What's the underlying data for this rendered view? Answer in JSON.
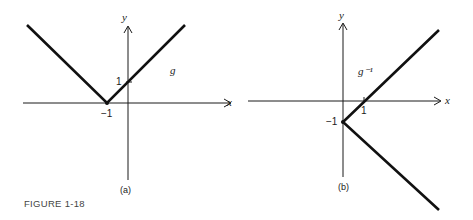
{
  "figure": {
    "caption": "FIGURE 1-18",
    "panels": [
      {
        "id": "a",
        "label": "(a)",
        "function_label": "g",
        "axis_x_label": "x",
        "axis_y_label": "y",
        "tick_x_label": "−1",
        "tick_y_label": "1",
        "description": "y = |x + 1|, vertex at (-1, 0), y-intercept 1"
      },
      {
        "id": "b",
        "label": "(b)",
        "function_label": "g⁻¹",
        "axis_x_label": "x",
        "axis_y_label": "y",
        "tick_x_label": "1",
        "tick_y_label": "−1",
        "description": "reflection of g across y = x: vertex at (0, -1), x-intercept 1"
      }
    ]
  },
  "colors": {
    "ink": "#1a1a1a",
    "background": "#ffffff"
  }
}
